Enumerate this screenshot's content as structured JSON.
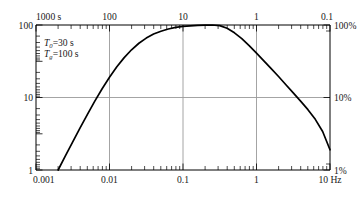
{
  "chart_data": {
    "type": "line",
    "title": "",
    "subtitle": "",
    "xlabel": "",
    "ylabel": "",
    "x_scale": "log",
    "y_scale": "log",
    "xlim": [
      0.001,
      10
    ],
    "ylim": [
      1,
      100
    ],
    "grid": true,
    "legend_position": "none",
    "bottom_axis": {
      "name": "frequency",
      "unit": "Hz",
      "tick_labels": [
        "0.001",
        "0.01",
        "0.1",
        "1",
        "10 Hz"
      ],
      "tick_values": [
        0.001,
        0.01,
        0.1,
        1,
        10
      ]
    },
    "top_axis": {
      "name": "period",
      "unit": "s",
      "tick_labels": [
        "1000 s",
        "100",
        "10",
        "1",
        "0.1"
      ],
      "tick_values": [
        1000,
        100,
        10,
        1,
        0.1
      ]
    },
    "left_axis": {
      "name": "magnification",
      "tick_labels": [
        "1",
        "10",
        "100"
      ],
      "tick_values": [
        1,
        10,
        100
      ]
    },
    "right_axis": {
      "name": "relative response",
      "tick_labels": [
        "1%",
        "10%",
        "100%"
      ],
      "tick_values": [
        1,
        10,
        100
      ]
    },
    "gridlines": {
      "vertical_at": [
        0.01,
        0.1,
        1
      ],
      "horizontal_at": [
        10
      ]
    },
    "annotations": [
      {
        "symbol": "T",
        "subscript": "0",
        "equals": "=30 s",
        "text": "T0=30 s"
      },
      {
        "symbol": "T",
        "subscript": "g",
        "equals": "=100 s",
        "text": "Tg=100 s"
      }
    ],
    "series": [
      {
        "name": "response",
        "x": [
          0.002,
          0.0025,
          0.00316,
          0.00398,
          0.00501,
          0.00631,
          0.00794,
          0.01,
          0.01259,
          0.01585,
          0.01995,
          0.02512,
          0.03162,
          0.03981,
          0.05012,
          0.0631,
          0.07943,
          0.1,
          0.12589,
          0.15849,
          0.19953,
          0.25119,
          0.31623,
          0.39811,
          0.50119,
          0.63096,
          0.79433,
          1.0,
          1.25893,
          1.58489,
          1.99526,
          2.51189,
          3.16228,
          3.98107,
          5.01187,
          6.30957,
          7.94328,
          10.0
        ],
        "y": [
          1.0,
          1.55,
          2.45,
          3.8,
          5.85,
          8.9,
          13.2,
          19.0,
          26.5,
          35.5,
          45.5,
          56.0,
          66.0,
          75.0,
          82.0,
          88.0,
          92.5,
          95.5,
          97.5,
          99.0,
          99.7,
          100.0,
          98.0,
          90.0,
          78.0,
          65.0,
          52.0,
          41.0,
          32.0,
          25.0,
          19.5,
          15.0,
          11.6,
          8.9,
          6.8,
          5.0,
          3.4,
          1.9
        ]
      }
    ],
    "peak": {
      "x": 0.0316,
      "y": 100
    }
  },
  "colors": {
    "curve": "#000000",
    "axis": "#000000",
    "grid": "#9a9a9a",
    "background": "#ffffff",
    "text": "#1a1a1a"
  }
}
